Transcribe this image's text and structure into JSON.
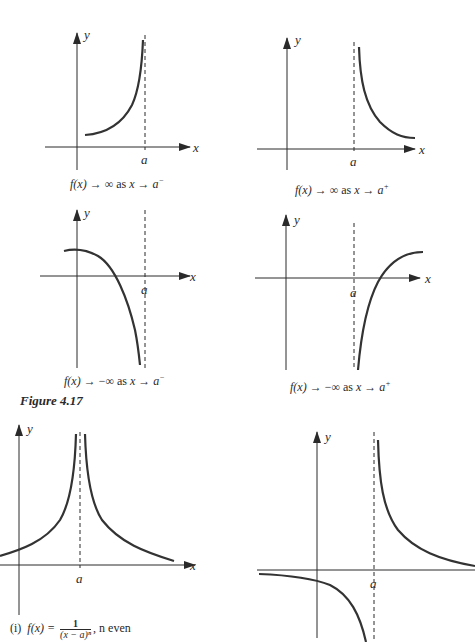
{
  "figure": {
    "label": "Figure 4.17",
    "colors": {
      "ink": "#2a2a2a",
      "curve": "#333333",
      "background": "#ffffff"
    }
  },
  "panels": [
    {
      "id": "p1",
      "axis_x_label": "x",
      "axis_y_label": "y",
      "asymptote_label": "a",
      "caption": {
        "lhs": "f(x)",
        "arrow": "→",
        "limit": "∞",
        "as": "as",
        "var": "x",
        "arrow2": "→",
        "target": "a",
        "side": "−"
      },
      "behavior": "f(x) → ∞ as x → a⁻"
    },
    {
      "id": "p2",
      "axis_x_label": "x",
      "axis_y_label": "y",
      "asymptote_label": "a",
      "caption": {
        "lhs": "f(x)",
        "arrow": "→",
        "limit": "∞",
        "as": "as",
        "var": "x",
        "arrow2": "→",
        "target": "a",
        "side": "+"
      },
      "behavior": "f(x) → ∞ as x → a⁺"
    },
    {
      "id": "p3",
      "axis_x_label": "x",
      "axis_y_label": "y",
      "asymptote_label": "a",
      "caption": {
        "lhs": "f(x)",
        "arrow": "→",
        "limit": "−∞",
        "as": "as",
        "var": "x",
        "arrow2": "→",
        "target": "a",
        "side": "−"
      },
      "behavior": "f(x) → −∞ as x → a⁻"
    },
    {
      "id": "p4",
      "axis_x_label": "x",
      "axis_y_label": "y",
      "asymptote_label": "a",
      "caption": {
        "lhs": "f(x)",
        "arrow": "→",
        "limit": "−∞",
        "as": "as",
        "var": "x",
        "arrow2": "→",
        "target": "a",
        "side": "+"
      },
      "behavior": "f(x) → −∞ as x → a⁺"
    },
    {
      "id": "p5",
      "axis_x_label": "x",
      "axis_y_label": "y",
      "asymptote_label": "a",
      "caption": {
        "index": "(i)",
        "lhs": "f(x) =",
        "numerator": "1",
        "denominator": "(x − a)ⁿ",
        "suffix": ", n even"
      },
      "behavior": "f(x) = 1/(x − a)^n, n even"
    },
    {
      "id": "p6",
      "axis_x_label": "",
      "axis_y_label": "y",
      "asymptote_label": "a",
      "caption": null,
      "behavior": "f(x) = 1/(x − a)^n, n odd (caption cut off)"
    }
  ]
}
